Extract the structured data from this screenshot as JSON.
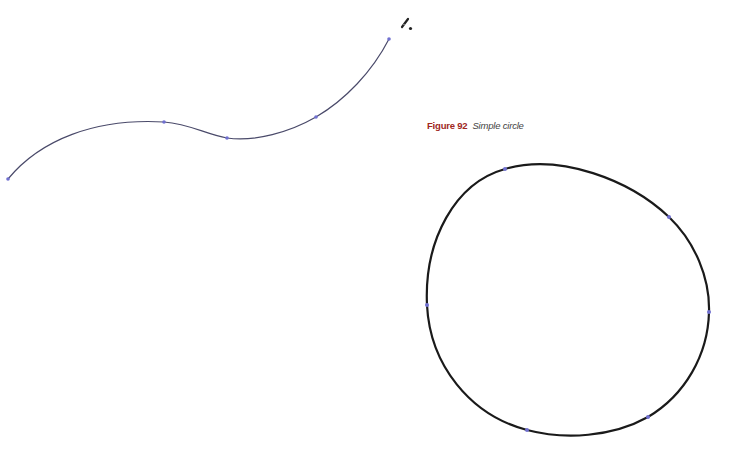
{
  "figure": {
    "label": "Figure 92",
    "title": "Simple circle",
    "label_color": "#a0281e"
  },
  "canvas": {
    "open_path": {
      "stroke_color": "#4a4a6a",
      "anchor_color": "#7070d0",
      "anchors": [
        [
          8,
          179
        ],
        [
          164,
          122
        ],
        [
          227,
          138
        ],
        [
          316,
          117
        ],
        [
          389,
          39
        ]
      ]
    },
    "closed_path": {
      "shape": "circle",
      "stroke_color": "#1a1a1a",
      "anchor_color": "#7070d0",
      "anchors": [
        [
          505,
          169
        ],
        [
          669,
          217
        ],
        [
          709,
          312
        ],
        [
          648,
          417
        ],
        [
          527,
          430
        ],
        [
          427,
          305
        ]
      ]
    },
    "cursor": "pen-tool-icon"
  }
}
